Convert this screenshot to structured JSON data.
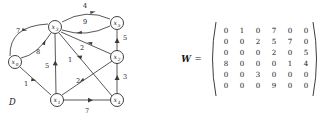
{
  "figure": {
    "graph": {
      "name": "D",
      "nodes": [
        {
          "id": "x0",
          "label": "x",
          "sub": "0",
          "cx": 15,
          "cy": 62
        },
        {
          "id": "x1",
          "label": "x",
          "sub": "1",
          "cx": 57,
          "cy": 100
        },
        {
          "id": "x2",
          "label": "x",
          "sub": "2",
          "cx": 117,
          "cy": 57
        },
        {
          "id": "x3",
          "label": "x",
          "sub": "3",
          "cx": 55,
          "cy": 27
        },
        {
          "id": "x4",
          "label": "x",
          "sub": "4",
          "cx": 117,
          "cy": 100
        },
        {
          "id": "x5",
          "label": "x",
          "sub": "5",
          "cx": 117,
          "cy": 23
        }
      ],
      "edges": [
        {
          "from": "x3",
          "to": "x5",
          "weight": "4",
          "wx": 85,
          "wy": 8,
          "style": "curve-up"
        },
        {
          "from": "x5",
          "to": "x3",
          "weight": "9",
          "wx": 85,
          "wy": 24,
          "style": "curve-down"
        },
        {
          "from": "x0",
          "to": "x3",
          "weight": "7",
          "wx": 18,
          "wy": 33,
          "style": "curve-outer"
        },
        {
          "from": "x0",
          "to": "x3",
          "weight": "8",
          "wx": 38,
          "wy": 54,
          "style": "curve-inner"
        },
        {
          "from": "x1",
          "to": "x3",
          "weight": "5",
          "wx": 47,
          "wy": 68,
          "style": "straight"
        },
        {
          "from": "x1",
          "to": "x0",
          "weight": "1",
          "wx": 26,
          "wy": 86,
          "style": "straight"
        },
        {
          "from": "x3",
          "to": "x2",
          "weight": "2",
          "wx": 82,
          "wy": 50,
          "style": "straight"
        },
        {
          "from": "x3",
          "to": "x4",
          "weight": "1",
          "wx": 70,
          "wy": 62,
          "style": "straight"
        },
        {
          "from": "x1",
          "to": "x2",
          "weight": "2",
          "wx": 78,
          "wy": 83,
          "style": "straight"
        },
        {
          "from": "x2",
          "to": "x5",
          "weight": "5",
          "wx": 125,
          "wy": 40,
          "style": "straight"
        },
        {
          "from": "x2",
          "to": "x4",
          "weight": "3",
          "wx": 125,
          "wy": 79,
          "style": "straight"
        },
        {
          "from": "x1",
          "to": "x4",
          "weight": "7",
          "wx": 87,
          "wy": 113,
          "style": "straight"
        }
      ]
    },
    "matrix": {
      "name": "W",
      "equals": "=",
      "rows": [
        [
          "0",
          "1",
          "0",
          "7",
          "0",
          "0"
        ],
        [
          "0",
          "0",
          "2",
          "5",
          "7",
          "0"
        ],
        [
          "0",
          "0",
          "0",
          "2",
          "0",
          "5"
        ],
        [
          "8",
          "0",
          "0",
          "0",
          "1",
          "4"
        ],
        [
          "0",
          "0",
          "3",
          "0",
          "0",
          "0"
        ],
        [
          "0",
          "0",
          "0",
          "9",
          "0",
          "0"
        ]
      ]
    }
  },
  "colors": {
    "ink": "#1a1a1a",
    "stroke": "#3a3a3a",
    "background": "#ffffff"
  }
}
